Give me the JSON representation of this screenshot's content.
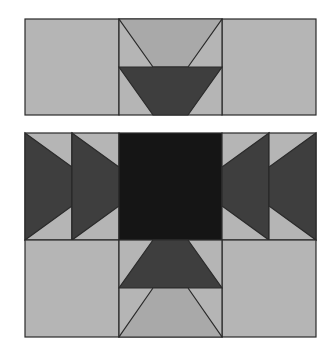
{
  "diagram": {
    "type": "quilt-block-layout",
    "colors": {
      "background": "#ffffff",
      "light": "#b5b5b5",
      "medium": "#a9a9a9",
      "dark": "#3e3e3e",
      "black": "#151515",
      "outline": "#2a2a2a"
    },
    "top_panel": {
      "name": "top-strip",
      "cells": [
        {
          "name": "top-left-square",
          "color": "light"
        },
        {
          "name": "top-center-flying-geese",
          "upper": "medium",
          "lower": "dark"
        },
        {
          "name": "top-right-square",
          "color": "light"
        }
      ]
    },
    "bottom_panel": {
      "name": "main-block",
      "rows": [
        {
          "name": "middle-row",
          "cells": [
            "geese-right",
            "geese-right",
            "center-square-black",
            "geese-left",
            "geese-left"
          ]
        },
        {
          "name": "bottom-row",
          "cells": [
            "light-square",
            "flying-geese-up",
            "light-square"
          ]
        }
      ]
    }
  }
}
